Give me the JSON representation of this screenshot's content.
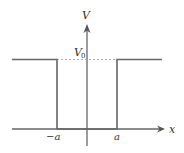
{
  "diagram": {
    "type": "finite-square-potential-well",
    "labels": {
      "y_axis": "V",
      "x_axis": "x",
      "level": "V",
      "level_subscript": "0",
      "left_wall": "−a",
      "right_wall": "a"
    },
    "colors": {
      "potential_line": "#666666",
      "axis": "#555555",
      "dashed_line": "#888888",
      "text": "#333333"
    }
  }
}
